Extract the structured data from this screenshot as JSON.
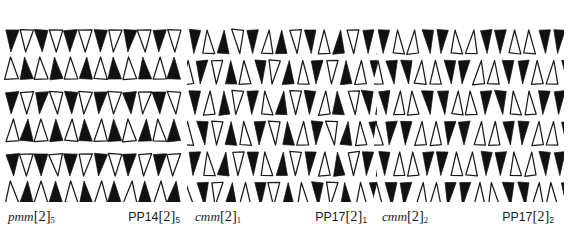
{
  "figure": {
    "background_color": "#ffffff",
    "ink_color": "#111111",
    "outline_color": "#1a1a1a",
    "panel_count": 3
  },
  "panels": [
    {
      "id": "panel-0",
      "left_label": {
        "base": "pmm",
        "bracket_open": "[",
        "bracket_value": "2",
        "bracket_close": "]",
        "subscript": "5",
        "full": "pmm[2]5"
      },
      "right_label": {
        "base": "PP14",
        "bracket_open": "[",
        "bracket_value": "2",
        "bracket_close": "]",
        "subscript": "5",
        "full": "PP14[2]5"
      },
      "motif": "paired-triangles",
      "columns": 6,
      "row_pairs": 3,
      "description": "Rows alternate between a down-pointing pair (filled left, outline right) and an up-pointing pair (outline left, filled right)."
    },
    {
      "id": "panel-1",
      "left_label": {
        "base": "cmm",
        "bracket_open": "[",
        "bracket_value": "2",
        "bracket_close": "]",
        "subscript": "1",
        "full": "cmm[2]1"
      },
      "right_label": {
        "base": "PP17",
        "bracket_open": "[",
        "bracket_value": "2",
        "bracket_close": "]",
        "subscript": "1",
        "full": "PP17[2]1"
      },
      "motif": "offset-triangle-lattice",
      "columns": 4,
      "rows": 6,
      "description": "Dense lattice of narrow triangles alternating fill and outline, alternate rows offset by half a cell."
    },
    {
      "id": "panel-2",
      "left_label": {
        "base": "cmm",
        "bracket_open": "[",
        "bracket_value": "2",
        "bracket_close": "]",
        "subscript": "2",
        "full": "cmm[2]2"
      },
      "right_label": {
        "base": "PP17",
        "bracket_open": "[",
        "bracket_value": "2",
        "bracket_close": "]",
        "subscript": "2",
        "full": "PP17[2]2"
      },
      "motif": "offset-triangle-lattice-variant",
      "columns": 4,
      "rows": 6,
      "description": "Dense lattice of narrow triangles grouped as filled-down / outline-up pairs, alternate rows offset by half a cell."
    }
  ]
}
